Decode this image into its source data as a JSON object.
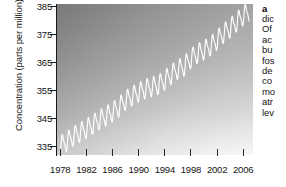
{
  "figure": {
    "panel_label": "a",
    "axes": {
      "ylabel": "Concentration (parts per million)",
      "ytick_labels": [
        "335",
        "345",
        "355",
        "365",
        "375",
        "385"
      ],
      "xtick_labels": [
        "1978",
        "1982",
        "1986",
        "1990",
        "1994",
        "1998",
        "2002",
        "2006"
      ]
    }
  },
  "caption": {
    "label": "a",
    "lines": [
      "dic",
      "Of",
      "ac",
      "bu",
      "fos",
      "de",
      "co",
      "mo",
      "atr",
      "lev"
    ]
  },
  "colors": {
    "line": "#ffffff",
    "axis": "#1a1a1a",
    "text": "#141414",
    "plot_background_top": "#8e8e8e",
    "plot_background_bottom": "#f6f6f6",
    "page_background": "#ffffff"
  },
  "chart_data": {
    "type": "line",
    "title": "",
    "xlabel": "",
    "ylabel": "Concentration (parts per million)",
    "xlim": [
      1977.5,
      2007.5
    ],
    "ylim": [
      332,
      386
    ],
    "yticks": [
      335,
      345,
      355,
      365,
      375,
      385
    ],
    "xticks": [
      1978,
      1982,
      1986,
      1990,
      1994,
      1998,
      2002,
      2006
    ],
    "grid": false,
    "legend": "none",
    "series": [
      {
        "name": "Atmospheric CO2 concentration",
        "description": "Monthly mean CO2 with seasonal sawtooth oscillation superimposed on a rising trend (Keeling curve)",
        "seasonal_amplitude_ppm": 6.2,
        "annual_trend": {
          "x": [
            1978,
            1979,
            1980,
            1981,
            1982,
            1983,
            1984,
            1985,
            1986,
            1987,
            1988,
            1989,
            1990,
            1991,
            1992,
            1993,
            1994,
            1995,
            1996,
            1997,
            1998,
            1999,
            2000,
            2001,
            2002,
            2003,
            2004,
            2005,
            2006,
            2007
          ],
          "values": [
            335.4,
            336.8,
            338.7,
            340.1,
            341.4,
            343.0,
            344.6,
            346.0,
            347.4,
            349.2,
            351.6,
            353.1,
            354.4,
            355.6,
            356.4,
            357.1,
            358.8,
            360.8,
            362.6,
            363.8,
            366.6,
            368.3,
            369.5,
            371.0,
            373.1,
            375.6,
            377.4,
            379.6,
            381.8,
            383.5
          ]
        }
      }
    ]
  }
}
